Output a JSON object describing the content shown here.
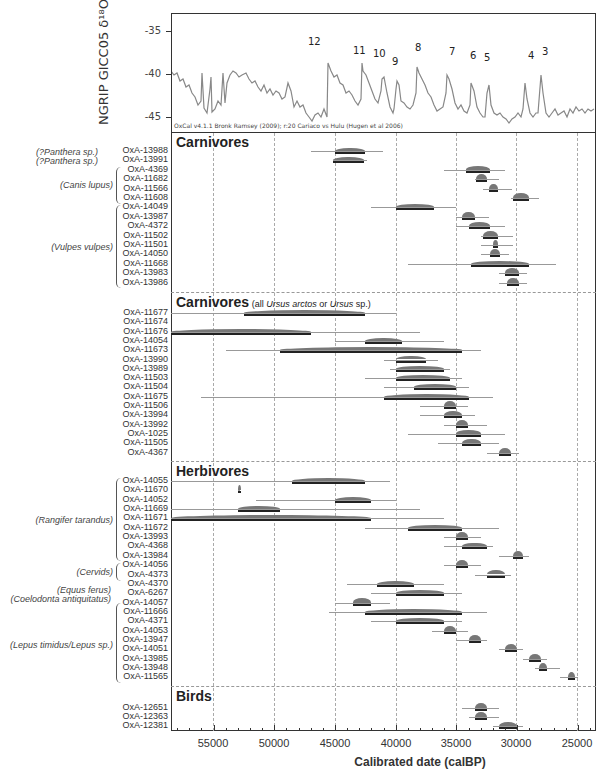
{
  "chart_data": {
    "type": "range-plot",
    "title": "",
    "xlabel": "Calibrated date (calBP)",
    "xlim": [
      58500,
      23500
    ],
    "x_ticks": [
      55000,
      50000,
      45000,
      40000,
      35000,
      30000,
      25000
    ],
    "grid": true,
    "top_panel": {
      "ylabel": "NGRIP GICC05 δ18O",
      "y_ticks": [
        -35,
        -40,
        -45
      ],
      "ylim": [
        -33,
        -47
      ],
      "note": "OxCal v4.1.1 Bronk Ramsey (2009); r:20 Cariaco vs Hulu (Hugen et al 2006)",
      "interstadial_labels": [
        {
          "label": "12",
          "x": 46800
        },
        {
          "label": "11",
          "x": 43300
        },
        {
          "label": "10",
          "x": 41400
        },
        {
          "label": "9",
          "x": 40200
        },
        {
          "label": "8",
          "x": 38200
        },
        {
          "label": "7",
          "x": 35500
        },
        {
          "label": "6",
          "x": 33700
        },
        {
          "label": "5",
          "x": 32500
        },
        {
          "label": "4",
          "x": 28900
        },
        {
          "label": "3",
          "x": 27700
        }
      ]
    },
    "sections": [
      {
        "title": "Carnivores",
        "subtitle": "",
        "samples": [
          {
            "id": "OxA-13988",
            "taxon": "(?Panthera sp.)",
            "from": 47000,
            "to": 41000,
            "hpd_from": 45000,
            "hpd_to": 42500
          },
          {
            "id": "OxA-13991",
            "taxon": "(?Panthera sp.)",
            "from": 45200,
            "to": 42400,
            "hpd_from": 45200,
            "hpd_to": 42600
          },
          {
            "id": "OxA-4369",
            "taxon": "(Canis lupus)",
            "from": 36000,
            "to": 31000,
            "hpd_from": 34200,
            "hpd_to": 32200
          },
          {
            "id": "OxA-11682",
            "taxon": "(Canis lupus)",
            "from": 33500,
            "to": 31500,
            "hpd_from": 33400,
            "hpd_to": 32500
          },
          {
            "id": "OxA-11566",
            "taxon": "(Canis lupus)",
            "from": 32800,
            "to": 30400,
            "hpd_from": 32300,
            "hpd_to": 31600
          },
          {
            "id": "OxA-11608",
            "taxon": "(Canis lupus)",
            "from": 30500,
            "to": 28200,
            "hpd_from": 30300,
            "hpd_to": 29000
          },
          {
            "id": "OxA-14049",
            "taxon": "(Vulpes vulpes)",
            "from": 42000,
            "to": 35000,
            "hpd_from": 40000,
            "hpd_to": 36800
          },
          {
            "id": "OxA-13987",
            "taxon": "(Vulpes vulpes)",
            "from": 35000,
            "to": 32300,
            "hpd_from": 34500,
            "hpd_to": 33500
          },
          {
            "id": "OxA-4372",
            "taxon": "(Vulpes vulpes)",
            "from": 35000,
            "to": 31000,
            "hpd_from": 34000,
            "hpd_to": 32200
          },
          {
            "id": "OxA-11502",
            "taxon": "(Vulpes vulpes)",
            "from": 33000,
            "to": 30300,
            "hpd_from": 32800,
            "hpd_to": 31600
          },
          {
            "id": "OxA-11501",
            "taxon": "(Vulpes vulpes)",
            "from": 33000,
            "to": 30300,
            "hpd_from": 32000,
            "hpd_to": 31600
          },
          {
            "id": "OxA-14050",
            "taxon": "(Vulpes vulpes)",
            "from": 33000,
            "to": 30700,
            "hpd_from": 32200,
            "hpd_to": 31400
          },
          {
            "id": "OxA-11668",
            "taxon": "(Vulpes vulpes)",
            "from": 39000,
            "to": 26800,
            "hpd_from": 33800,
            "hpd_to": 29000
          },
          {
            "id": "OxA-13983",
            "taxon": "(Vulpes vulpes)",
            "from": 31500,
            "to": 29200,
            "hpd_from": 31000,
            "hpd_to": 29800
          },
          {
            "id": "OxA-13986",
            "taxon": "(Vulpes vulpes)",
            "from": 31500,
            "to": 29200,
            "hpd_from": 30800,
            "hpd_to": 29800
          }
        ]
      },
      {
        "title": "Carnivores",
        "subtitle_prefix": "(all ",
        "subtitle_italic1": "Ursus arctos",
        "subtitle_mid": " or ",
        "subtitle_italic2": "Ursus",
        "subtitle_suffix": " sp.)",
        "samples": [
          {
            "id": "OxA-11677",
            "taxon": "",
            "from": 58500,
            "to": 40000,
            "hpd_from": 52500,
            "hpd_to": 42500
          },
          {
            "id": "OxA-11674",
            "taxon": "",
            "from": null,
            "to": null,
            "hpd_from": null,
            "hpd_to": null
          },
          {
            "id": "OxA-11676",
            "taxon": "",
            "from": 58500,
            "to": 38000,
            "hpd_from": 58500,
            "hpd_to": 47000
          },
          {
            "id": "OxA-14054",
            "taxon": "",
            "from": 45000,
            "to": 36000,
            "hpd_from": 42500,
            "hpd_to": 39500
          },
          {
            "id": "OxA-11673",
            "taxon": "",
            "from": 54000,
            "to": 33000,
            "hpd_from": 49500,
            "hpd_to": 34500
          },
          {
            "id": "OxA-13990",
            "taxon": "",
            "from": 41000,
            "to": 36500,
            "hpd_from": 40000,
            "hpd_to": 37500
          },
          {
            "id": "OxA-13989",
            "taxon": "",
            "from": 40500,
            "to": 35500,
            "hpd_from": 40000,
            "hpd_to": 36000
          },
          {
            "id": "OxA-11503",
            "taxon": "",
            "from": 42500,
            "to": 34500,
            "hpd_from": 40000,
            "hpd_to": 35500
          },
          {
            "id": "OxA-11504",
            "taxon": "",
            "from": 41000,
            "to": 34000,
            "hpd_from": 38500,
            "hpd_to": 35000
          },
          {
            "id": "OxA-11675",
            "taxon": "",
            "from": 56000,
            "to": 32000,
            "hpd_from": 41000,
            "hpd_to": 34000
          },
          {
            "id": "OxA-11506",
            "taxon": "",
            "from": 38000,
            "to": 34000,
            "hpd_from": 36000,
            "hpd_to": 35000
          },
          {
            "id": "OxA-13994",
            "taxon": "",
            "from": 38000,
            "to": 33500,
            "hpd_from": 36000,
            "hpd_to": 34500
          },
          {
            "id": "OxA-13992",
            "taxon": "",
            "from": 36000,
            "to": 32500,
            "hpd_from": 35000,
            "hpd_to": 34000
          },
          {
            "id": "OxA-1025",
            "taxon": "",
            "from": 39000,
            "to": 31000,
            "hpd_from": 35000,
            "hpd_to": 33000
          },
          {
            "id": "OxA-11505",
            "taxon": "",
            "from": 36500,
            "to": 31500,
            "hpd_from": 34500,
            "hpd_to": 33000
          },
          {
            "id": "OxA-4367",
            "taxon": "",
            "from": 32500,
            "to": 29800,
            "hpd_from": 31500,
            "hpd_to": 30500
          }
        ]
      },
      {
        "title": "Herbivores",
        "samples": [
          {
            "id": "OxA-14055",
            "taxon": "(Rangifer tarandus)",
            "from": 58500,
            "to": 40500,
            "hpd_from": 48500,
            "hpd_to": 42500
          },
          {
            "id": "OxA-11670",
            "taxon": "(Rangifer tarandus)",
            "from": 53000,
            "to": 52800,
            "hpd_from": 53000,
            "hpd_to": 52800
          },
          {
            "id": "OxA-14052",
            "taxon": "(Rangifer tarandus)",
            "from": 51500,
            "to": 40000,
            "hpd_from": 45000,
            "hpd_to": 42000
          },
          {
            "id": "OxA-11669",
            "taxon": "(Rangifer tarandus)",
            "from": 58500,
            "to": 38000,
            "hpd_from": 53000,
            "hpd_to": 49500
          },
          {
            "id": "OxA-11671",
            "taxon": "(Rangifer tarandus)",
            "from": 58500,
            "to": 36000,
            "hpd_from": 58500,
            "hpd_to": 42000
          },
          {
            "id": "OxA-11672",
            "taxon": "(Rangifer tarandus)",
            "from": 42500,
            "to": 31500,
            "hpd_from": 39000,
            "hpd_to": 34500
          },
          {
            "id": "OxA-13993",
            "taxon": "(Rangifer tarandus)",
            "from": 36000,
            "to": 33000,
            "hpd_from": 35000,
            "hpd_to": 34000
          },
          {
            "id": "OxA-4368",
            "taxon": "(Rangifer tarandus)",
            "from": 36000,
            "to": 32000,
            "hpd_from": 34500,
            "hpd_to": 32500
          },
          {
            "id": "OxA-13984",
            "taxon": "(Rangifer tarandus)",
            "from": 31500,
            "to": 29000,
            "hpd_from": 30300,
            "hpd_to": 29500
          },
          {
            "id": "OxA-14056",
            "taxon": "(Cervids)",
            "from": 36000,
            "to": 33000,
            "hpd_from": 35000,
            "hpd_to": 34000
          },
          {
            "id": "OxA-4373",
            "taxon": "(Cervids)",
            "from": 33500,
            "to": 30500,
            "hpd_from": 32500,
            "hpd_to": 31000
          },
          {
            "id": "OxA-4370",
            "taxon": "(Equus ferus)",
            "from": 44000,
            "to": 36000,
            "hpd_from": 41500,
            "hpd_to": 38500
          },
          {
            "id": "OxA-6267",
            "taxon": "(Coelodonta antiquitatus)",
            "from": 42000,
            "to": 34500,
            "hpd_from": 40000,
            "hpd_to": 36000
          },
          {
            "id": "OxA-14057",
            "taxon": "(Lepus timidus/Lepus sp.)",
            "from": 45000,
            "to": 40500,
            "hpd_from": 43500,
            "hpd_to": 42000
          },
          {
            "id": "OxA-11666",
            "taxon": "(Lepus timidus/Lepus sp.)",
            "from": 45500,
            "to": 32500,
            "hpd_from": 42500,
            "hpd_to": 34500
          },
          {
            "id": "OxA-4371",
            "taxon": "(Lepus timidus/Lepus sp.)",
            "from": 42000,
            "to": 34500,
            "hpd_from": 40000,
            "hpd_to": 36000
          },
          {
            "id": "OxA-14053",
            "taxon": "(Lepus timidus/Lepus sp.)",
            "from": 37000,
            "to": 34000,
            "hpd_from": 36000,
            "hpd_to": 35000
          },
          {
            "id": "OxA-13947",
            "taxon": "(Lepus timidus/Lepus sp.)",
            "from": 35000,
            "to": 32500,
            "hpd_from": 34000,
            "hpd_to": 33000
          },
          {
            "id": "OxA-14051",
            "taxon": "(Lepus timidus/Lepus sp.)",
            "from": 31500,
            "to": 29500,
            "hpd_from": 31000,
            "hpd_to": 30000
          },
          {
            "id": "OxA-13985",
            "taxon": "(Lepus timidus/Lepus sp.)",
            "from": 29500,
            "to": 27500,
            "hpd_from": 29000,
            "hpd_to": 28000
          },
          {
            "id": "OxA-13948",
            "taxon": "(Lepus timidus/Lepus sp.)",
            "from": 28500,
            "to": 26500,
            "hpd_from": 28200,
            "hpd_to": 27500
          },
          {
            "id": "OxA-11565",
            "taxon": "(Lepus timidus/Lepus sp.)",
            "from": 26500,
            "to": 25000,
            "hpd_from": 25800,
            "hpd_to": 25200
          }
        ]
      },
      {
        "title": "Birds",
        "samples": [
          {
            "id": "OxA-12651",
            "taxon": "",
            "from": 34500,
            "to": 31500,
            "hpd_from": 33500,
            "hpd_to": 32500
          },
          {
            "id": "OxA-12363",
            "taxon": "",
            "from": 34000,
            "to": 31500,
            "hpd_from": 33500,
            "hpd_to": 32500
          },
          {
            "id": "OxA-12381",
            "taxon": "",
            "from": 32000,
            "to": 29500,
            "hpd_from": 31500,
            "hpd_to": 30000
          }
        ]
      }
    ]
  },
  "labels": {
    "ngrip_ylabel": "NGRIP GICC05 δ¹⁸O",
    "oxcal_note": "OxCal v4.1.1 Bronk Ramsey (2009); r:20 Cariaco vs Hulu (Hugen et al 2006)",
    "y35": "-35",
    "y40": "-40",
    "y45": "-45",
    "x55": "55000",
    "x50": "50000",
    "x45": "45000",
    "x40": "40000",
    "x35": "35000",
    "x30": "30000",
    "x25": "25000",
    "xtitle": "Calibrated date (calBP)",
    "sect1": "Carnivores",
    "sect2": "Carnivores",
    "sect2_sub_a": " (all ",
    "sect2_sub_i1": "Ursus arctos",
    "sect2_sub_b": " or ",
    "sect2_sub_i2": "Ursus",
    "sect2_sub_c": " sp.)",
    "sect3": "Herbivores",
    "sect4": "Birds",
    "taxa": {
      "panthera1": "(?Panthera sp.)",
      "panthera2": "(?Panthera sp.)",
      "canis": "(Canis lupus)",
      "vulpes": "(Vulpes vulpes)",
      "rangifer": "(Rangifer tarandus)",
      "cervids": "(Cervids)",
      "equus": "(Equus ferus)",
      "coelodonta": "(Coelodonta antiquitatus)",
      "lepus": "(Lepus timidus/Lepus sp.)"
    },
    "peaks": {
      "p12": "12",
      "p11": "11",
      "p10": "10",
      "p9": "9",
      "p8": "8",
      "p7": "7",
      "p6": "6",
      "p5": "5",
      "p4": "4",
      "p3": "3"
    }
  }
}
